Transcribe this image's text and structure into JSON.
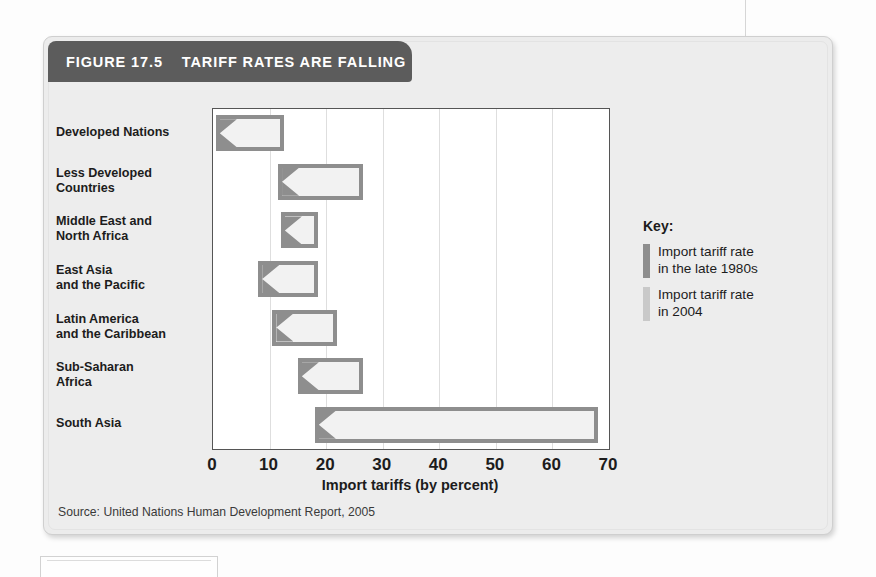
{
  "figure": {
    "number_label": "FIGURE 17.5",
    "title": "TARIFF RATES ARE FALLING",
    "source": "Source: United Nations Human Development Report, 2005"
  },
  "key": {
    "heading": "Key:",
    "entries": [
      {
        "label": "Import tariff rate\nin the late 1980s",
        "color": "#8e8e8e"
      },
      {
        "label": "Import tariff rate\nin 2004",
        "color": "#c9c9c9"
      }
    ]
  },
  "chart_data": {
    "type": "bar",
    "orientation": "horizontal",
    "title": "TARIFF RATES ARE FALLING",
    "xlabel": "Import tariffs (by percent)",
    "ylabel": "",
    "xlim": [
      0,
      70
    ],
    "xticks": [
      0,
      10,
      20,
      30,
      40,
      50,
      60,
      70
    ],
    "grid": "vertical",
    "legend_position": "right",
    "categories": [
      "Developed Nations",
      "Less Developed Countries",
      "Middle East and North Africa",
      "East Asia and the Pacific",
      "Latin America and the Caribbean",
      "Sub-Saharan Africa",
      "South Asia"
    ],
    "series": [
      {
        "name": "Import tariff rate in the late 1980s",
        "color": "#8e8e8e",
        "values": [
          12.5,
          26.5,
          18.5,
          18.5,
          22.0,
          26.5,
          68.0
        ]
      },
      {
        "name": "Import tariff rate in 2004",
        "color": "#c9c9c9",
        "values": [
          0.5,
          11.5,
          12.0,
          8.0,
          10.5,
          15.0,
          18.0
        ]
      }
    ]
  },
  "labels": {
    "rows": [
      {
        "line1": "Developed Nations",
        "line2": ""
      },
      {
        "line1": "Less Developed",
        "line2": "Countries"
      },
      {
        "line1": "Middle East and",
        "line2": "North Africa"
      },
      {
        "line1": "East Asia",
        "line2": "and the Pacific"
      },
      {
        "line1": "Latin America",
        "line2": "and the Caribbean"
      },
      {
        "line1": "Sub-Saharan",
        "line2": "Africa"
      },
      {
        "line1": "South Asia",
        "line2": ""
      }
    ]
  }
}
